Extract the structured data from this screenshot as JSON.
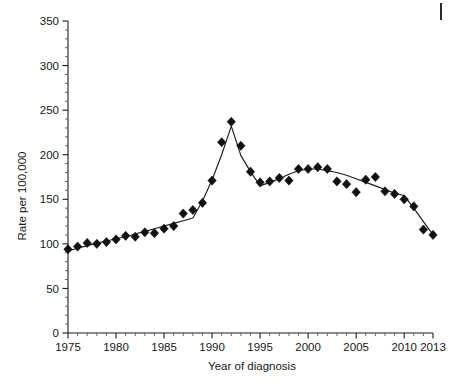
{
  "figure": {
    "corner_mark": "page-edge-rule"
  },
  "chart_data": {
    "type": "line",
    "title": "",
    "subtitle": "",
    "xlabel": "Year of diagnosis",
    "ylabel": "Rate per 100,000",
    "xlim": [
      1975,
      2013
    ],
    "ylim": [
      0,
      350
    ],
    "grid": false,
    "legend": "none",
    "marker": "filled-diamond",
    "marker_color": "#111111",
    "line_color": "#1c1c1c",
    "y_ticks": [
      0,
      50,
      100,
      150,
      200,
      250,
      300,
      350
    ],
    "y_tick_labels": [
      "0",
      "50",
      "100",
      "150",
      "200",
      "250",
      "300",
      "350"
    ],
    "y_minor_step": 10,
    "x_ticks": [
      1975,
      1980,
      1985,
      1990,
      1995,
      2000,
      2005,
      2010,
      2013
    ],
    "x_tick_labels": [
      "1975",
      "1980",
      "1985",
      "1990",
      "1995",
      "2000",
      "2005",
      "2010",
      "2013"
    ],
    "x_minor_step": 1,
    "x": [
      1975,
      1976,
      1977,
      1978,
      1979,
      1980,
      1981,
      1982,
      1983,
      1984,
      1985,
      1986,
      1987,
      1988,
      1989,
      1990,
      1991,
      1992,
      1993,
      1994,
      1995,
      1996,
      1997,
      1998,
      1999,
      2000,
      2001,
      2002,
      2003,
      2004,
      2005,
      2006,
      2007,
      2008,
      2009,
      2010,
      2011,
      2012,
      2013
    ],
    "series": [
      {
        "name": "Observed rate",
        "kind": "scatter",
        "values": [
          94,
          97,
          101,
          100,
          102,
          105,
          109,
          108,
          113,
          112,
          117,
          120,
          134,
          138,
          146,
          171,
          214,
          237,
          210,
          181,
          169,
          170,
          174,
          171,
          184,
          184,
          186,
          184,
          170,
          167,
          158,
          172,
          175,
          159,
          156,
          150,
          142,
          116,
          110
        ]
      },
      {
        "name": "Joinpoint trend",
        "kind": "line",
        "values": [
          92,
          95,
          98,
          101,
          103,
          106,
          108,
          111,
          114,
          117,
          120,
          123,
          126,
          129,
          148,
          172,
          200,
          232,
          199,
          181,
          165,
          169,
          173,
          178,
          182,
          184,
          184,
          182,
          180,
          177,
          173,
          169,
          165,
          161,
          157,
          154,
          140,
          125,
          110
        ]
      }
    ],
    "annotations": []
  }
}
